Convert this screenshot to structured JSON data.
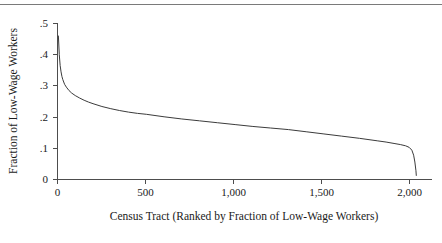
{
  "chart_data": {
    "type": "line",
    "title": "",
    "subtitle": "",
    "xlabel": "Census Tract (Ranked by Fraction of Low-Wage Workers)",
    "ylabel": "Fraction of Low-Wage Workers",
    "xlim": [
      0,
      2100
    ],
    "ylim": [
      0,
      0.5
    ],
    "grid": false,
    "legend": null,
    "x_ticks": [
      0,
      500,
      1000,
      1500,
      2000
    ],
    "x_tick_labels": [
      "0",
      "500",
      "1,000",
      "1,500",
      "2,000"
    ],
    "y_ticks": [
      0,
      0.1,
      0.2,
      0.3,
      0.4,
      0.5
    ],
    "y_tick_labels": [
      "0",
      ".1",
      ".2",
      ".3",
      ".4",
      ".5"
    ],
    "series": [
      {
        "name": "Fraction of low-wage workers by ranked census tract",
        "x": [
          5,
          10,
          15,
          20,
          25,
          30,
          40,
          50,
          65,
          80,
          100,
          125,
          150,
          175,
          200,
          250,
          300,
          350,
          400,
          450,
          500,
          600,
          700,
          800,
          900,
          1000,
          1100,
          1200,
          1300,
          1400,
          1500,
          1600,
          1700,
          1800,
          1850,
          1900,
          1930,
          1960,
          1980,
          1995,
          2005,
          2012,
          2018,
          2020
        ],
        "y": [
          0.46,
          0.4,
          0.365,
          0.345,
          0.33,
          0.32,
          0.305,
          0.296,
          0.285,
          0.277,
          0.269,
          0.261,
          0.254,
          0.248,
          0.243,
          0.234,
          0.227,
          0.221,
          0.216,
          0.212,
          0.209,
          0.201,
          0.194,
          0.188,
          0.182,
          0.176,
          0.17,
          0.165,
          0.16,
          0.153,
          0.146,
          0.139,
          0.132,
          0.124,
          0.12,
          0.115,
          0.112,
          0.108,
          0.103,
          0.094,
          0.078,
          0.056,
          0.028,
          0.013
        ]
      }
    ]
  },
  "axes": {
    "y_title": "Fraction of Low-Wage Workers",
    "x_title": "Census Tract (Ranked by Fraction of Low-Wage Workers)"
  }
}
